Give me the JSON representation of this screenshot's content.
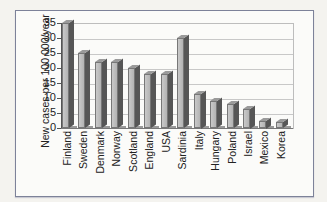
{
  "chart_data": {
    "type": "bar",
    "title": "",
    "xlabel": "",
    "ylabel": "New cases per 100 000/year",
    "ylim": [
      0,
      35
    ],
    "yticks": [
      0,
      5,
      10,
      15,
      20,
      25,
      30,
      35
    ],
    "grid": true,
    "style": "3d-bar",
    "categories": [
      "Finland",
      "Sweden",
      "Denmark",
      "Norway",
      "Scotland",
      "England",
      "USA",
      "Sardinia",
      "Italy",
      "Hungary",
      "Poland",
      "Israel",
      "Mexico",
      "Korea"
    ],
    "values": [
      35,
      25,
      22,
      22,
      20,
      18,
      18,
      30,
      11.5,
      9,
      8,
      6.5,
      2.5,
      2
    ],
    "colors": {
      "bar_front": "#bdbdbd",
      "bar_side": "#565656",
      "frame_border": "#7d8299"
    }
  }
}
